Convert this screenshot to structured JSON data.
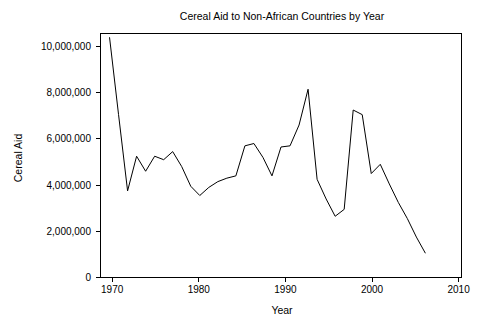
{
  "chart_data": {
    "type": "line",
    "title": "Cereal Aid to Non-African Countries by Year",
    "xlabel": "Year",
    "ylabel": "Cereal Aid",
    "grid": false,
    "legend": false,
    "xlim": [
      1970,
      2010
    ],
    "ylim": [
      0,
      10600000
    ],
    "x_ticks": [
      1970,
      1980,
      1990,
      2000,
      2010
    ],
    "x_tick_labels": [
      "1970",
      "1980",
      "1990",
      "2000",
      "2010"
    ],
    "y_ticks": [
      0,
      2000000,
      4000000,
      6000000,
      8000000,
      10000000
    ],
    "y_tick_labels": [
      "0",
      "2,000,000",
      "4,000,000",
      "6,000,000",
      "8,000,000",
      "10,000,000"
    ],
    "line_color": "#000000",
    "x": [
      1971,
      1972,
      1973,
      1974,
      1975,
      1976,
      1977,
      1978,
      1979,
      1980,
      1981,
      1982,
      1983,
      1984,
      1985,
      1986,
      1987,
      1988,
      1989,
      1990,
      1991,
      1992,
      1993,
      1994,
      1995,
      1996,
      1997,
      1998,
      1999,
      2000,
      2001,
      2002,
      2003,
      2004,
      2005,
      2006
    ],
    "values": [
      10400000,
      7050000,
      3750000,
      5250000,
      4600000,
      5250000,
      5100000,
      5450000,
      4800000,
      3950000,
      3550000,
      3900000,
      4150000,
      4300000,
      4400000,
      5700000,
      5800000,
      5200000,
      4400000,
      5650000,
      5700000,
      6600000,
      8150000,
      4250000,
      3400000,
      2650000,
      2950000,
      7250000,
      7050000,
      4500000,
      4900000,
      4050000,
      3250000,
      2550000,
      1750000,
      1050000
    ],
    "series": [
      {
        "name": "Cereal Aid",
        "values": [
          10400000,
          7050000,
          3750000,
          5250000,
          4600000,
          5250000,
          5100000,
          5450000,
          4800000,
          3950000,
          3550000,
          3900000,
          4150000,
          4300000,
          4400000,
          5700000,
          5800000,
          5200000,
          4400000,
          5650000,
          5700000,
          6600000,
          8150000,
          4250000,
          3400000,
          2650000,
          2950000,
          7250000,
          7050000,
          4500000,
          4900000,
          4050000,
          3250000,
          2550000,
          1750000,
          1050000
        ]
      }
    ]
  }
}
